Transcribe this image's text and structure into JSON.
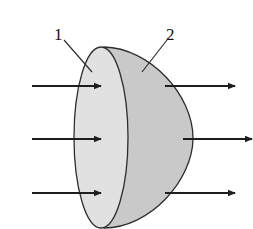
{
  "diagram": {
    "labels": [
      {
        "id": "1",
        "text": "1",
        "refers_to": "flat circular face"
      },
      {
        "id": "2",
        "text": "2",
        "refers_to": "curved hemispherical surface"
      }
    ],
    "arrows_in_count": 3,
    "arrows_out_count": 3,
    "arrow_direction": "left-to-right",
    "colors": {
      "background": "#ffffff",
      "flat_face_fill": "#e1e1e1",
      "dome_fill": "#c9c9c9",
      "stroke": "#2e2e2e",
      "arrow": "#1e1e1e",
      "label_text": "#111111"
    }
  }
}
